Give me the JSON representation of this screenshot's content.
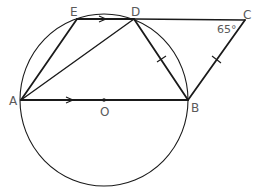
{
  "diagram": {
    "type": "geometry",
    "points": {
      "A": {
        "label": "A",
        "x": 21,
        "y": 100
      },
      "O": {
        "label": "O",
        "x": 104,
        "y": 100
      },
      "B": {
        "label": "B",
        "x": 188,
        "y": 100
      },
      "E": {
        "label": "E",
        "x": 77,
        "y": 19
      },
      "D": {
        "label": "D",
        "x": 134,
        "y": 19
      },
      "C": {
        "label": "C",
        "x": 245,
        "y": 20
      }
    },
    "circle": {
      "center": "O",
      "cx": 104,
      "cy": 100,
      "rx": 84,
      "ry": 86
    },
    "segments": [
      "AB",
      "AE",
      "AD",
      "ED",
      "DC",
      "DB",
      "BC"
    ],
    "parallel_marks": [
      "ED",
      "AB"
    ],
    "equal_marks": [
      "DB",
      "BC"
    ],
    "angle": {
      "vertex": "C",
      "label": "65°",
      "value": 65
    },
    "stroke_color": "#1a1a1a",
    "label_color": "#5a5a5a"
  }
}
